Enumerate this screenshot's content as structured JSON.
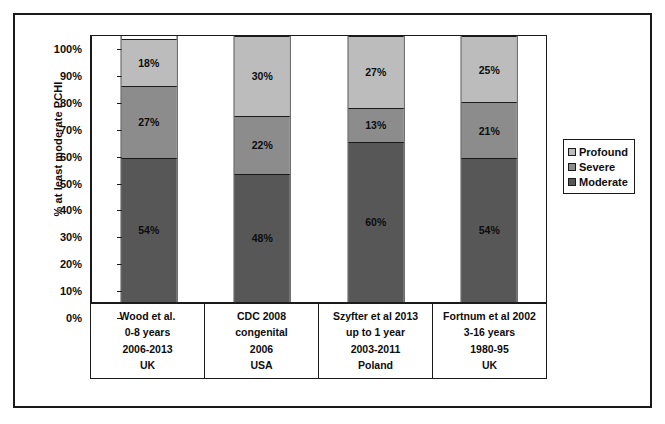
{
  "chart_data": {
    "type": "bar",
    "subtype": "stacked-percentage-column",
    "title": "",
    "xlabel": "",
    "ylabel": "% at least moderate PCHI",
    "ylim": [
      0,
      100
    ],
    "ytick_labels": [
      "100%",
      "90%",
      "80%",
      "70%",
      "60%",
      "50%",
      "40%",
      "30%",
      "20%",
      "10%",
      "0%"
    ],
    "ytick_values": [
      100,
      90,
      80,
      70,
      60,
      50,
      40,
      30,
      20,
      10,
      0
    ],
    "grid": false,
    "legend_position": "right",
    "categories": [
      "Wood et al. 0-8 years 2006-2013 UK",
      "CDC 2008 congenital 2006 USA",
      "Szyfter et al 2013 up to 1 year 2003-2011 Poland",
      "Fortnum et al 2002 3-16 years 1980-95 UK"
    ],
    "category_label_lines": [
      [
        "Wood et al.",
        "0-8 years",
        "2006-2013",
        "UK"
      ],
      [
        "CDC 2008",
        "congenital",
        "2006",
        "USA"
      ],
      [
        "Szyfter et al 2013",
        "up to 1 year",
        "2003-2011",
        "Poland"
      ],
      [
        "Fortnum et al 2002",
        "3-16 years",
        "1980-95",
        "UK"
      ]
    ],
    "series": [
      {
        "name": "Moderate",
        "color": "#575757",
        "values": [
          54,
          48,
          60,
          54
        ],
        "labels": [
          "54%",
          "48%",
          "60%",
          "54%"
        ]
      },
      {
        "name": "Severe",
        "color": "#8c8c8c",
        "values": [
          27,
          22,
          13,
          21
        ],
        "labels": [
          "27%",
          "22%",
          "13%",
          "21%"
        ]
      },
      {
        "name": "Profound",
        "color": "#bcbcbc",
        "values": [
          18,
          30,
          27,
          25
        ],
        "labels": [
          "18%",
          "30%",
          "27%",
          "25%"
        ]
      }
    ]
  },
  "legend": {
    "items": [
      {
        "label": "Profound",
        "color": "#bcbcbc"
      },
      {
        "label": "Severe",
        "color": "#8c8c8c"
      },
      {
        "label": "Moderate",
        "color": "#575757"
      }
    ]
  },
  "colors": {
    "axis": "#1a1a1a",
    "text": "#0d0d0d",
    "background": "#ffffff",
    "profound": "#bcbcbc",
    "severe": "#8c8c8c",
    "moderate": "#575757"
  }
}
